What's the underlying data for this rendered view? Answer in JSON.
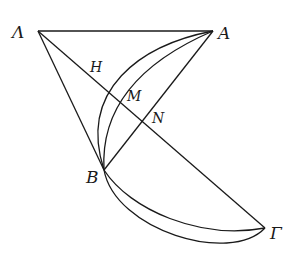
{
  "diagram": {
    "type": "geometric-figure",
    "points": {
      "Lambda": {
        "label": "Λ",
        "x": 38,
        "y": 31
      },
      "A": {
        "label": "A",
        "x": 213,
        "y": 31
      },
      "B": {
        "label": "B",
        "x": 104,
        "y": 170
      },
      "Gamma": {
        "label": "Γ",
        "x": 265,
        "y": 228
      },
      "H": {
        "label": "H",
        "x": 103,
        "y": 86
      },
      "M": {
        "label": "M",
        "x": 123,
        "y": 103
      },
      "N": {
        "label": "N",
        "x": 146,
        "y": 124
      }
    },
    "segments": [
      "ΛA",
      "ΛB",
      "ΛΓ",
      "AB"
    ],
    "arcs": [
      "A-H-B outer arc",
      "A-M-B inner arc",
      "B-Γ upper arc",
      "B-Γ lower arc"
    ]
  }
}
